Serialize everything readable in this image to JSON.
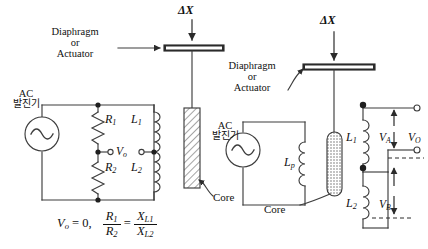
{
  "left_circuit": {
    "displacement_label": "ΔX",
    "diaphragm_label_line1": "Diaphragm",
    "diaphragm_label_line2": "or",
    "diaphragm_label_line3": "Actuator",
    "source_label_line1": "AC",
    "source_label_line2": "발진기",
    "core_label": "Core",
    "components": {
      "r1": "R",
      "r1_sub": "1",
      "r2": "R",
      "r2_sub": "2",
      "l1": "L",
      "l1_sub": "1",
      "l2": "L",
      "l2_sub": "2",
      "vo": "V",
      "vo_sub": "o"
    },
    "equation": {
      "lhs": "V",
      "lhs_sub": "o",
      "equals": "= 0,",
      "frac1_num": "R",
      "frac1_num_sub": "1",
      "frac1_den": "R",
      "frac1_den_sub": "2",
      "eq2": "=",
      "frac2_num": "X",
      "frac2_num_sub": "L1",
      "frac2_den": "X",
      "frac2_den_sub": "L2"
    }
  },
  "right_circuit": {
    "displacement_label": "ΔX",
    "diaphragm_label_line1": "Diaphragm",
    "diaphragm_label_line2": "or",
    "diaphragm_label_line3": "Actuator",
    "source_label_line1": "AC",
    "source_label_line2": "발진기",
    "core_label": "Core",
    "components": {
      "lp": "L",
      "lp_sub": "p",
      "l1": "L",
      "l1_sub": "1",
      "l2": "L",
      "l2_sub": "2",
      "va": "V",
      "va_sub": "A",
      "vb": "V",
      "vb_sub": "B",
      "vo": "V",
      "vo_sub": "O"
    }
  },
  "colors": {
    "line": "#3d3d3d",
    "text": "#111111",
    "bar_fill": "#2b2b2b",
    "background": "#ffffff"
  },
  "icons": {
    "ac_source": "sine-wave-icon",
    "resistor": "zigzag-resistor-icon",
    "inductor": "coil-inductor-icon",
    "arrow_down": "arrow-down-icon",
    "arrow_up": "arrow-up-icon",
    "node_dot": "junction-dot-icon",
    "terminal": "open-terminal-circle-icon"
  }
}
